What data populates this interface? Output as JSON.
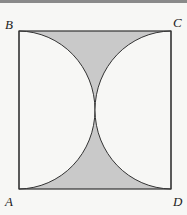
{
  "diagram": {
    "labels": {
      "A": "A",
      "B": "B",
      "C": "C",
      "D": "D"
    },
    "colors": {
      "shade": "#c9c9c9",
      "stroke": "#333333",
      "background": "#f7f7f5"
    },
    "square": {
      "x": 19,
      "y": 31,
      "width": 152,
      "height": 158
    }
  }
}
